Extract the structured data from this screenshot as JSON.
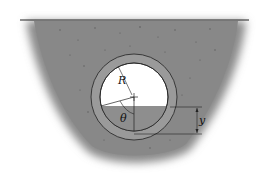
{
  "diagram": {
    "type": "cross-section",
    "labels": {
      "radius": "R",
      "angle": "θ",
      "depth": "y"
    },
    "colors": {
      "soil": "#8a8a8a",
      "soil_speckle": "#5a5a5a",
      "pipe_wall": "#9a9a9a",
      "water": "#8e8e8e",
      "air": "#ffffff",
      "lines": "#222222"
    }
  }
}
